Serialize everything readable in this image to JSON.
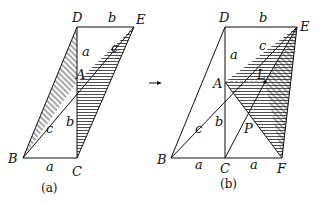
{
  "figure_a": {
    "caption": "(a)",
    "points": {
      "D": "D",
      "E": "E",
      "A": "A",
      "B": "B",
      "C": "C"
    },
    "side_labels": {
      "DE": "b",
      "DA": "a",
      "AE": "c",
      "AC": "b",
      "BA": "c",
      "BC": "a"
    }
  },
  "figure_b": {
    "caption": "(b)",
    "points": {
      "D": "D",
      "E": "E",
      "A": "A",
      "B": "B",
      "C": "C",
      "F": "F",
      "L": "L",
      "P": "P"
    },
    "side_labels": {
      "DE": "b",
      "DA": "a",
      "AE": "c",
      "AC": "b",
      "BA": "c",
      "BC": "a",
      "CF": "a"
    }
  },
  "arrow": "→"
}
